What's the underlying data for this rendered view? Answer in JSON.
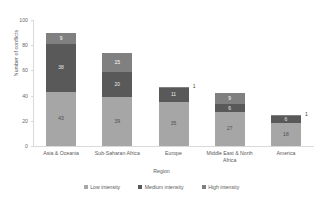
{
  "chart_data": {
    "type": "bar",
    "subtype": "stacked-vertical",
    "title": "",
    "xlabel": "Region",
    "ylabel": "Number of conflicts",
    "ylim": [
      0,
      100
    ],
    "yticks": [
      0,
      20,
      40,
      60,
      80,
      100
    ],
    "grid": false,
    "legend_position": "bottom",
    "categories": [
      "Asia & Oceania",
      "Sub-Saharan Africa",
      "Europe",
      "Middle East & North Africa",
      "America"
    ],
    "series": [
      {
        "name": "Low intensity",
        "color": "#a6a6a6",
        "values": [
          43,
          39,
          35,
          27,
          18
        ]
      },
      {
        "name": "Medium intensity",
        "color": "#595959",
        "values": [
          38,
          20,
          11,
          6,
          6
        ]
      },
      {
        "name": "High intensity",
        "color": "#808080",
        "values": [
          9,
          15,
          1,
          9,
          1
        ]
      }
    ],
    "totals": [
      90,
      74,
      47,
      42,
      25
    ],
    "label_placement": {
      "outside_top": [
        true,
        false,
        true,
        false,
        true
      ]
    }
  },
  "legend": {
    "items": [
      {
        "label": "Low intensity",
        "color": "#a6a6a6"
      },
      {
        "label": "Medium intensity",
        "color": "#595959"
      },
      {
        "label": "High intensity",
        "color": "#808080"
      }
    ]
  },
  "axes": {
    "y_title": "Number of conflicts",
    "x_title": "Region",
    "y_ticks": [
      "0",
      "20",
      "40",
      "60",
      "80",
      "100"
    ]
  }
}
